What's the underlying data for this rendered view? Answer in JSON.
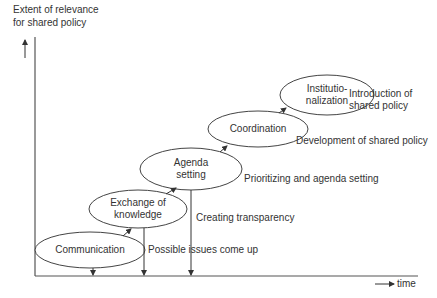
{
  "axes": {
    "y_label": "Extent of relevance\nfor shared policy",
    "y_label_line1": "Extent of relevance",
    "y_label_line2": "for shared policy",
    "x_label": "time"
  },
  "stages": [
    {
      "id": "communication",
      "label_line1": "Communication",
      "label_line2": "",
      "outcome": "Possible issues come up"
    },
    {
      "id": "exchange",
      "label_line1": "Exchange of",
      "label_line2": "knowledge",
      "outcome": "Creating transparency"
    },
    {
      "id": "agenda",
      "label_line1": "Agenda",
      "label_line2": "setting",
      "outcome": "Prioritizing and agenda setting"
    },
    {
      "id": "coordination",
      "label_line1": "Coordination",
      "label_line2": "",
      "outcome": "Development of shared policy"
    },
    {
      "id": "institutionalization",
      "label_line1": "Institutio-",
      "label_line2": "nalization",
      "outcome_line1": "Introduction of",
      "outcome_line2": "shared policy"
    }
  ],
  "colors": {
    "line": "#333333",
    "text": "#333333",
    "background": "#ffffff"
  }
}
